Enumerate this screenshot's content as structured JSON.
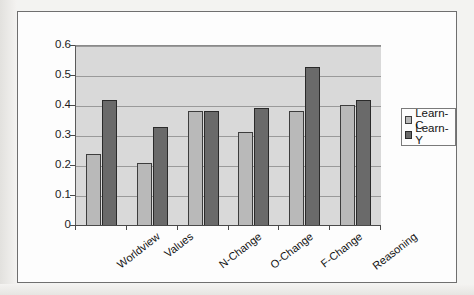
{
  "chart_data": {
    "type": "bar",
    "title": "",
    "xlabel": "",
    "ylabel": "",
    "categories": [
      "Worldview",
      "Values",
      "N-Change",
      "O-Change",
      "F-Change",
      "Reasoning"
    ],
    "series": [
      {
        "name": "Learn-C",
        "color": "#b9b9b9",
        "values": [
          0.24,
          0.21,
          0.385,
          0.315,
          0.385,
          0.405
        ]
      },
      {
        "name": "Learn-Y",
        "color": "#6a6a6a",
        "values": [
          0.42,
          0.33,
          0.385,
          0.395,
          0.53,
          0.42
        ]
      }
    ],
    "ylim": [
      0,
      0.6
    ],
    "yticks": [
      0,
      0.1,
      0.2,
      0.3,
      0.4,
      0.5,
      0.6
    ],
    "ytick_labels": [
      "0",
      "0.1",
      "0.2",
      "0.3",
      "0.4",
      "0.5",
      "0.6"
    ],
    "grid": true,
    "grid_axis": "y",
    "legend_position": "right",
    "plot_background": "#d9d9d9",
    "figure_background": "#fdfdfd"
  },
  "legend": {
    "entries": [
      {
        "label": "Learn-C",
        "swatch": "series-c"
      },
      {
        "label": "Learn-Y",
        "swatch": "series-y"
      }
    ]
  }
}
